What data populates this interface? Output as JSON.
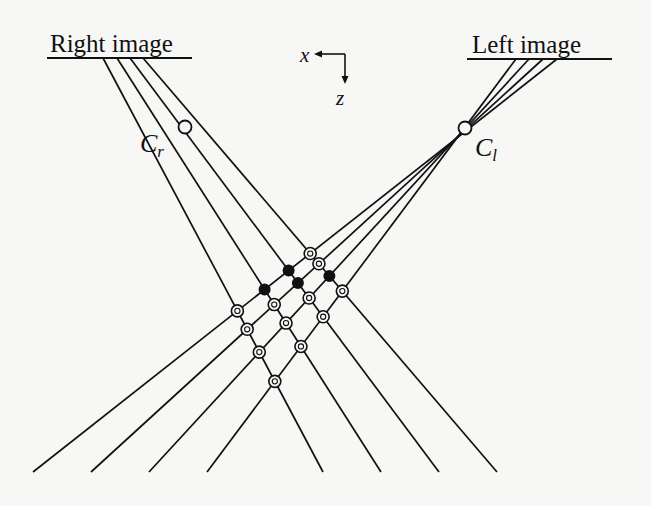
{
  "diagram": {
    "type": "stereo-correspondence-geometry",
    "image_planes": {
      "right": {
        "label": "Right image",
        "x1": 47,
        "x2": 192,
        "y": 58
      },
      "left": {
        "label": "Left image",
        "x1": 467,
        "x2": 612,
        "y": 59
      }
    },
    "cameras": {
      "right": {
        "label": "C",
        "subscript": "r",
        "cx": 185,
        "cy": 127
      },
      "left": {
        "label": "C",
        "subscript": "l",
        "cx": 465,
        "cy": 128
      }
    },
    "axes": {
      "x_label": "x",
      "z_label": "z"
    },
    "ray_bottom_y": 472,
    "right_camera_ray_ends_x": [
      323,
      381,
      439,
      497
    ],
    "left_camera_ray_ends_x": [
      33,
      91,
      149,
      207
    ],
    "right_image_ray_starts_x": [
      103,
      117,
      130,
      143
    ],
    "left_image_ray_starts_x": [
      516,
      529,
      543,
      557
    ],
    "matches_black": [
      [
        281,
        280
      ],
      [
        313,
        280
      ],
      [
        345,
        280
      ],
      [
        377,
        280
      ]
    ],
    "colors": {
      "ink": "#111111",
      "paper": "#f7f7f5"
    }
  }
}
